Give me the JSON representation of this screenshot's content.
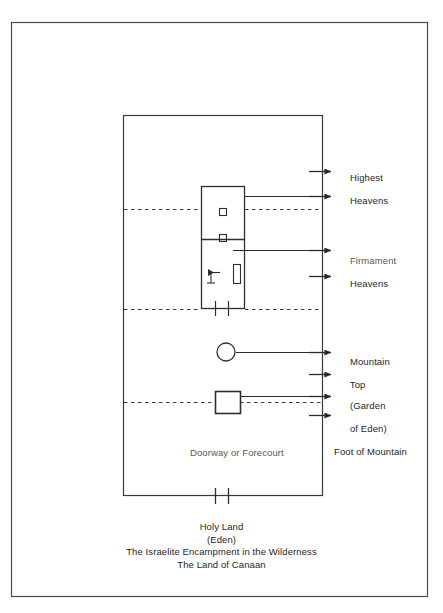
{
  "figure": {
    "type": "diagram",
    "background_color": "#ffffff",
    "line_color": "#333333",
    "text_color": "#1f1f1f",
    "faded_text_color": "#5a5754"
  },
  "right_labels": [
    {
      "id": "highest-heavens",
      "line1": "Highest",
      "line2": "Heavens",
      "faded": false
    },
    {
      "id": "firmament-heavens",
      "line1": "Firmament",
      "line2": "Heavens",
      "faded": true
    },
    {
      "id": "mountain-top",
      "line1": "Mountain",
      "line2": "Top",
      "faded": false
    },
    {
      "id": "garden-of-eden",
      "line1": "(Garden",
      "line2": "of Eden)",
      "faded": false
    },
    {
      "id": "foot-of-mountain",
      "line1": "Foot of Mountain",
      "line2": "",
      "faded": false
    }
  ],
  "interior_labels": [
    {
      "id": "doorway-or-forecourt",
      "text": "Doorway or Forecourt",
      "faded": true
    }
  ],
  "caption": [
    "Holy Land",
    "(Eden)",
    "The Israelite Encampment in the Wilderness",
    "The Land of Canaan"
  ],
  "shapes": {
    "outer_frame": {
      "x": 11,
      "y": 22,
      "width": 417,
      "height": 575
    },
    "inner_rectangle": {
      "x": 123,
      "y": 115,
      "width": 200,
      "height": 381
    },
    "tabernacle": {
      "x": 201,
      "y": 186,
      "width": 44,
      "height": 123
    },
    "holy_of_holies_divider_y": 239,
    "small_square_upper": {
      "x": 219,
      "y": 208,
      "size": 7
    },
    "small_square_lower": {
      "x": 219,
      "y": 234,
      "size": 7
    },
    "tall_rectangle": {
      "x": 233,
      "y": 264,
      "width": 7,
      "height": 19
    },
    "mountain_top_circle": {
      "cx": 226,
      "cy": 352,
      "r": 9
    },
    "eden_box": {
      "x": 215,
      "y": 391,
      "width": 25,
      "height": 22
    },
    "dashed_lines_y": [
      209,
      309,
      402
    ],
    "bottom_ticks_x": [
      215,
      228
    ]
  },
  "arrows": [
    {
      "id": "arrow-highest-heavens-upper",
      "y": 171,
      "has_leader": false
    },
    {
      "id": "arrow-highest-heavens-lower",
      "y": 196,
      "has_leader": true,
      "leader_from_x": 245
    },
    {
      "id": "arrow-firmament-upper",
      "y": 250,
      "has_leader": true,
      "leader_from_x": 233
    },
    {
      "id": "arrow-firmament-lower",
      "y": 276,
      "has_leader": false
    },
    {
      "id": "arrow-mountain-top",
      "y": 352,
      "has_leader": true,
      "leader_from_x": 236
    },
    {
      "id": "arrow-mountain-top-lower",
      "y": 374,
      "has_leader": false
    },
    {
      "id": "arrow-garden-of-eden",
      "y": 396,
      "has_leader": true,
      "leader_from_x": 240
    },
    {
      "id": "arrow-foot-of-mountain",
      "y": 415,
      "has_leader": false
    }
  ],
  "label_positions": {
    "highest_heavens": {
      "x": 339,
      "y": 165
    },
    "firmament_heavens": {
      "x": 339,
      "y": 246
    },
    "mountain_top": {
      "x": 339,
      "y": 346
    },
    "garden_of_eden": {
      "x": 339,
      "y": 390
    },
    "foot_of_mountain": {
      "x": 334,
      "y": 449
    },
    "doorway_or_forecourt": {
      "x": 190,
      "y": 450
    }
  }
}
